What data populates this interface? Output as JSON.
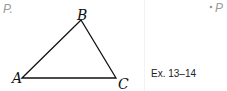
{
  "left_panel": {
    "point_label": "P.",
    "triangle": {
      "vertices": [
        {
          "name": "A",
          "x": 22,
          "y": 78
        },
        {
          "name": "B",
          "x": 81,
          "y": 20
        },
        {
          "name": "C",
          "x": 116,
          "y": 78
        }
      ],
      "stroke_color": "#111111"
    }
  },
  "right_panel": {
    "point_label": "P",
    "caption": "Ex. 13–14"
  }
}
